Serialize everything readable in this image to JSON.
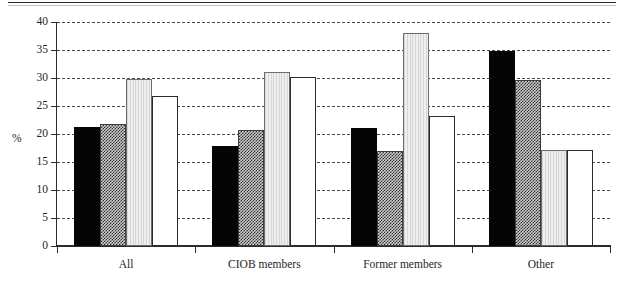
{
  "chart_data": {
    "type": "bar",
    "title": "",
    "subtitle": "",
    "xlabel": "",
    "ylabel": "%",
    "ylim": [
      0,
      40
    ],
    "ytick_step": 5,
    "yticks": [
      0,
      5,
      10,
      15,
      20,
      25,
      30,
      35,
      40
    ],
    "ytick_labels": [
      "0",
      "5",
      "10",
      "15",
      "20",
      "25",
      "30",
      "35",
      "40"
    ],
    "grid": true,
    "grid_style": "dashed-horizontal",
    "legend": "none",
    "legend_position": "none",
    "categories": [
      "All",
      "CIOB members",
      "Former members",
      "Other"
    ],
    "series": [
      {
        "name": "series-1",
        "style": "solid-black",
        "color": "#050505",
        "values": [
          21.3,
          17.8,
          21.1,
          34.9
        ]
      },
      {
        "name": "series-2",
        "style": "crosshatch-gray",
        "color": "#3d3d3d",
        "values": [
          21.7,
          20.7,
          17.0,
          29.7
        ]
      },
      {
        "name": "series-3",
        "style": "light-gray",
        "color": "#e3e3e3",
        "values": [
          29.8,
          31.1,
          38.1,
          17.2
        ]
      },
      {
        "name": "series-4",
        "style": "white-outline",
        "color": "#ffffff",
        "values": [
          26.8,
          30.1,
          23.2,
          17.2
        ]
      }
    ],
    "annotations": []
  },
  "figure": {
    "has_top_rule": true,
    "background": "#ffffff",
    "axis_color": "#2b2b2b",
    "grid_color": "#4a4a4a"
  }
}
